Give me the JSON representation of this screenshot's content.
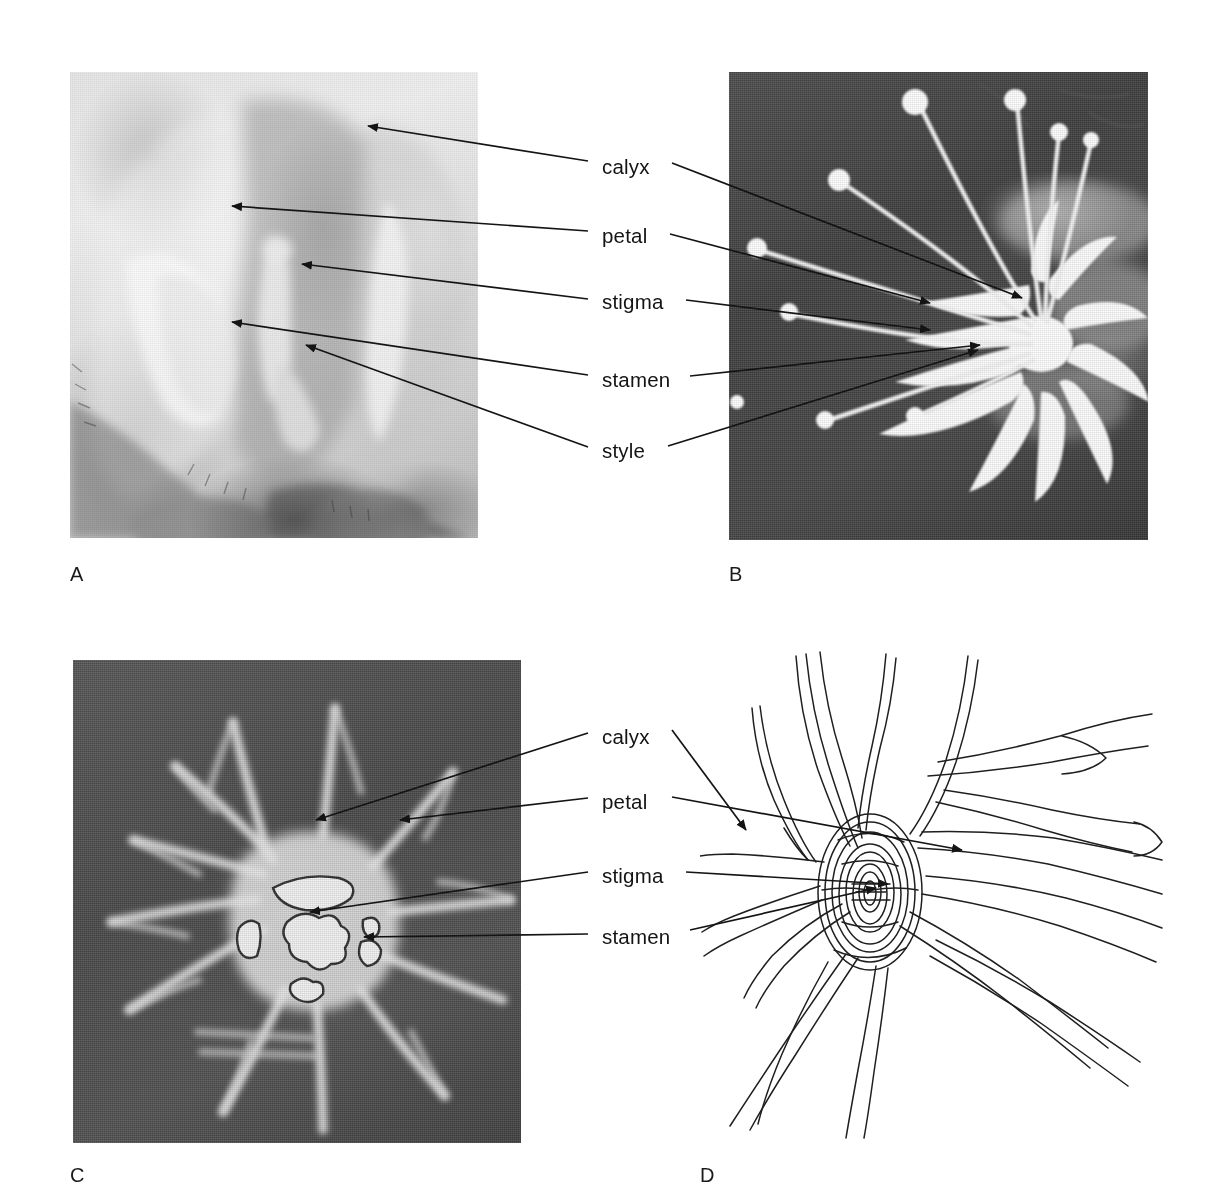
{
  "figure": {
    "background": "#ffffff",
    "width": 1229,
    "height": 1200
  },
  "panels": [
    {
      "letter": "A",
      "type": "photomicrograph",
      "tone": "light",
      "description": "Pale halftone photograph of a flower showing calyx, petal, stigma, stamen and style",
      "arrow_direction": "left",
      "label_count": 5
    },
    {
      "letter": "B",
      "type": "photomicrograph",
      "tone": "dark-field",
      "description": "Dark background photograph of a white flower with long stamens bearing round anthers",
      "arrow_direction": "right",
      "label_count": 5
    },
    {
      "letter": "C",
      "type": "drawing",
      "tone": "dark-field",
      "description": "White chalk-like drawing on dark ground of a radiating flower with pale centre",
      "arrow_direction": "left",
      "label_count": 4
    },
    {
      "letter": "D",
      "type": "drawing",
      "tone": "line-art",
      "description": "Pencil line drawing of a flower with elongated radiating petals and dense scribbled centre",
      "arrow_direction": "mixed",
      "label_count": 4
    }
  ],
  "labels": {
    "top_group": [
      {
        "text": "calyx",
        "x": 602,
        "y": 168
      },
      {
        "text": "petal",
        "x": 602,
        "y": 237
      },
      {
        "text": "stigma",
        "x": 602,
        "y": 303
      },
      {
        "text": "stamen",
        "x": 602,
        "y": 381
      },
      {
        "text": "style",
        "x": 602,
        "y": 452
      }
    ],
    "bottom_group": [
      {
        "text": "calyx",
        "x": 602,
        "y": 738
      },
      {
        "text": "petal",
        "x": 602,
        "y": 803
      },
      {
        "text": "stigma",
        "x": 602,
        "y": 877
      },
      {
        "text": "stamen",
        "x": 602,
        "y": 938
      }
    ]
  },
  "panel_letters": [
    {
      "text": "A",
      "x": 70,
      "y": 575
    },
    {
      "text": "B",
      "x": 729,
      "y": 575
    },
    {
      "text": "C",
      "x": 70,
      "y": 1176
    },
    {
      "text": "D",
      "x": 700,
      "y": 1176
    }
  ],
  "colors": {
    "ink": "#141414",
    "page": "#ffffff",
    "dark_field": "#474747",
    "light_field": "#e5e5e5"
  }
}
